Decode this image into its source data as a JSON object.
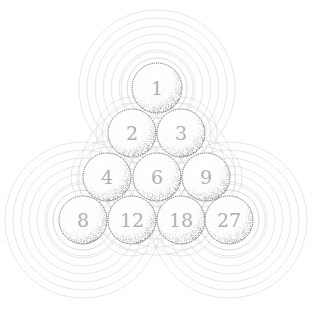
{
  "diagram": {
    "title": "",
    "type": "triangular-ball-pyramid",
    "rows": [
      [
        "1"
      ],
      [
        "2",
        "3"
      ],
      [
        "4",
        "6",
        "9"
      ],
      [
        "8",
        "12",
        "18",
        "27"
      ]
    ],
    "balls": [
      {
        "label": "1",
        "cx": 157,
        "cy": 88,
        "r": 25
      },
      {
        "label": "2",
        "cx": 132,
        "cy": 133,
        "r": 24
      },
      {
        "label": "3",
        "cx": 181,
        "cy": 133,
        "r": 24
      },
      {
        "label": "4",
        "cx": 107,
        "cy": 177,
        "r": 24
      },
      {
        "label": "6",
        "cx": 157,
        "cy": 177,
        "r": 24
      },
      {
        "label": "9",
        "cx": 206,
        "cy": 177,
        "r": 24
      },
      {
        "label": "8",
        "cx": 83,
        "cy": 220,
        "r": 24
      },
      {
        "label": "12",
        "cx": 132,
        "cy": 220,
        "r": 24
      },
      {
        "label": "18",
        "cx": 181,
        "cy": 220,
        "r": 24
      },
      {
        "label": "27",
        "cx": 229,
        "cy": 220,
        "r": 24
      }
    ],
    "rings": {
      "centers": [
        [
          157,
          88
        ],
        [
          83,
          220
        ],
        [
          229,
          220
        ],
        [
          157,
          177
        ]
      ],
      "radii": [
        30,
        38,
        46,
        54,
        62,
        70,
        78
      ]
    },
    "colors": {
      "ring": "#d6d6d6",
      "ball_outline": "#555555",
      "ball_shade": "#333333",
      "number": "#b0b0b0"
    }
  }
}
